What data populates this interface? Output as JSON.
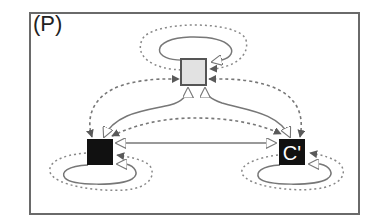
{
  "panel": {
    "label": "(P)"
  },
  "nodes": [
    {
      "id": "top",
      "label": "",
      "fill": "#e2e2e2",
      "stroke": "#555555"
    },
    {
      "id": "C",
      "label": "C",
      "fill": "#111111",
      "text_color": "#ffffff"
    },
    {
      "id": "C-prime",
      "label": "C'",
      "fill": "#111111",
      "text_color": "#ffffff"
    }
  ],
  "edges": {
    "solid_style": "solid line, open (white) triangular arrowhead",
    "dashed_style": "dashed line, filled dark-gray arrowhead",
    "dotted_style": "dotted self-loop, filled dark-gray arrowhead",
    "list": [
      {
        "from": "top",
        "to": "top",
        "style": "solid-loop"
      },
      {
        "from": "top",
        "to": "top",
        "style": "dotted-loop"
      },
      {
        "from": "C",
        "to": "C",
        "style": "solid-loop"
      },
      {
        "from": "C",
        "to": "C",
        "style": "dotted-loop"
      },
      {
        "from": "C-prime",
        "to": "C-prime",
        "style": "solid-loop"
      },
      {
        "from": "C-prime",
        "to": "C-prime",
        "style": "dotted-loop"
      },
      {
        "from": "C",
        "to": "top",
        "style": "solid",
        "bidirectional": true
      },
      {
        "from": "C-prime",
        "to": "top",
        "style": "solid",
        "bidirectional": true
      },
      {
        "from": "C",
        "to": "C-prime",
        "style": "solid",
        "bidirectional": true
      },
      {
        "from": "C",
        "to": "top",
        "style": "dashed",
        "bidirectional": true
      },
      {
        "from": "C-prime",
        "to": "top",
        "style": "dashed",
        "bidirectional": true
      },
      {
        "from": "C",
        "to": "C-prime",
        "style": "dashed",
        "bidirectional": true
      }
    ]
  },
  "colors": {
    "frame": "#6a6a6a",
    "edge": "#6e6e6e",
    "arrow_fill": "#5a5a5a",
    "open_arrow_fill": "#ffffff"
  }
}
